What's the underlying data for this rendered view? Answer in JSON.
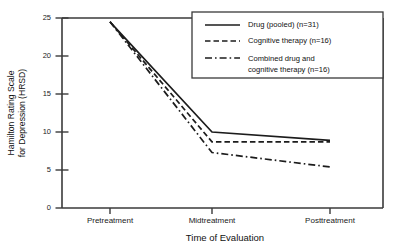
{
  "chart_data": {
    "type": "line",
    "title": "",
    "xlabel": "Time of Evaluation",
    "ylabel": "Hamilton Rating Scale for Depression (HRSD)",
    "ylabel_line1": "Hamilton Rating Scale",
    "ylabel_line2": "for Depression (HRSD)",
    "categories": [
      "Pretreatment",
      "Midtreatment",
      "Posttreatment"
    ],
    "ylim": [
      0,
      25
    ],
    "yticks": [
      0,
      5,
      10,
      15,
      20,
      25
    ],
    "ytick_labels": [
      "0",
      "5",
      "10",
      "15",
      "20",
      "25"
    ],
    "grid": false,
    "legend_position": "upper-right",
    "series": [
      {
        "name": "Drug (pooled) (n=31)",
        "label_line1": "Drug (pooled) (n=31)",
        "label_line2": "",
        "style": "solid",
        "values": [
          24.5,
          10.0,
          8.9
        ]
      },
      {
        "name": "Cognitive therapy (n=16)",
        "label_line1": "Cognitive therapy (n=16)",
        "label_line2": "",
        "style": "dashed",
        "values": [
          24.5,
          8.7,
          8.7
        ]
      },
      {
        "name": "Combined drug and cognitive therapy (n=16)",
        "label_line1": "Combined drug and",
        "label_line2": "cognitive therapy (n=16)",
        "style": "dash-dot",
        "values": [
          24.5,
          7.3,
          5.4
        ]
      }
    ],
    "colors": {
      "line": "#1c1c1c",
      "axis": "#3a3a3a",
      "background": "#ffffff",
      "text": "#111111"
    }
  }
}
